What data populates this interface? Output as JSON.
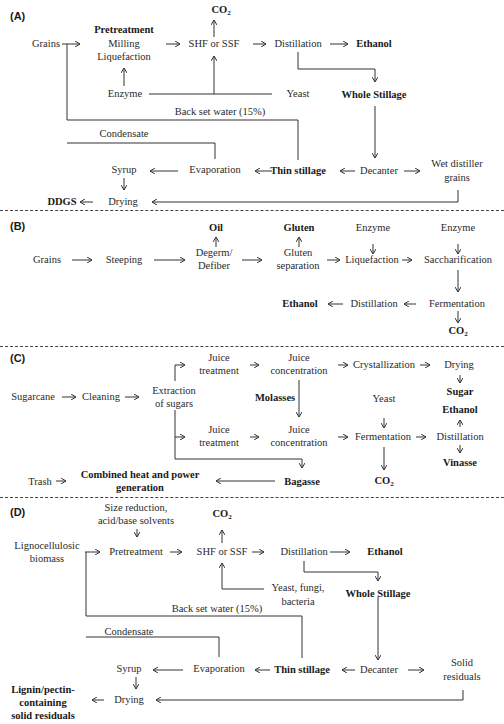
{
  "panels": {
    "A": {
      "label": "(A)",
      "grains": "Grains",
      "pretreatment": "Pretreatment",
      "milling": "Milling",
      "liquefaction": "Liquefaction",
      "co2": "CO",
      "co2_sub": "2",
      "shf": "SHF or SSF",
      "distillation": "Distillation",
      "ethanol": "Ethanol",
      "enzyme": "Enzyme",
      "yeast": "Yeast",
      "whole_stillage": "Whole Stillage",
      "backset": "Back set water (15%)",
      "condensate": "Condensate",
      "syrup": "Syrup",
      "evaporation": "Evaporation",
      "thin_stillage": "Thin stillage",
      "decanter": "Decanter",
      "wdg_1": "Wet distiller",
      "wdg_2": "grains",
      "ddgs": "DDGS",
      "drying": "Drying"
    },
    "B": {
      "label": "(B)",
      "oil": "Oil",
      "gluten": "Gluten",
      "enzyme1": "Enzyme",
      "enzyme2": "Enzyme",
      "grains": "Grains",
      "steeping": "Steeping",
      "degerm_1": "Degerm/",
      "degerm_2": "Defiber",
      "gluten_sep_1": "Gluten",
      "gluten_sep_2": "separation",
      "liquefaction": "Liquefaction",
      "saccharification": "Saccharification",
      "ethanol": "Ethanol",
      "distillation": "Distillation",
      "fermentation": "Fermentation",
      "co2": "CO",
      "co2_sub": "2"
    },
    "C": {
      "label": "(C)",
      "juice_t1_1": "Juice",
      "juice_t1_2": "treatment",
      "juice_c1_1": "Juice",
      "juice_c1_2": "concentration",
      "crystallization": "Crystallization",
      "drying": "Drying",
      "sugarcane": "Sugarcane",
      "cleaning": "Cleaning",
      "extraction_1": "Extraction",
      "extraction_2": "of sugars",
      "molasses": "Molasses",
      "yeast": "Yeast",
      "sugar": "Sugar",
      "ethanol": "Ethanol",
      "juice_t2_1": "Juice",
      "juice_t2_2": "treatment",
      "juice_c2_1": "Juice",
      "juice_c2_2": "concentration",
      "fermentation": "Fermentation",
      "distillation": "Distillation",
      "vinasse": "Vinasse",
      "trash": "Trash",
      "chp_1": "Combined heat and power",
      "chp_2": "generation",
      "bagasse": "Bagasse",
      "co2": "CO",
      "co2_sub": "2"
    },
    "D": {
      "label": "(D)",
      "size_red_1": "Size reduction,",
      "size_red_2": "acid/base solvents",
      "co2": "CO",
      "co2_sub": "2",
      "ligno_1": "Lignocellulosic",
      "ligno_2": "biomass",
      "pretreatment": "Pretreatment",
      "shf": "SHF or SSF",
      "distillation": "Distillation",
      "ethanol": "Ethanol",
      "yeast_1": "Yeast, fungi,",
      "yeast_2": "bacteria",
      "whole_stillage": "Whole Stillage",
      "backset": "Back set water (15%)",
      "condensate": "Condensate",
      "syrup": "Syrup",
      "evaporation": "Evaporation",
      "thin_stillage": "Thin stillage",
      "decanter": "Decanter",
      "solid_1": "Solid",
      "solid_2": "residuals",
      "drying": "Drying",
      "lignin_1": "Lignin/pectin-",
      "lignin_2": "containing",
      "lignin_3": "solid residuals"
    }
  },
  "arrow_glyphs": {
    "right": "→",
    "left": "←",
    "up": "↑",
    "down": "↓"
  }
}
